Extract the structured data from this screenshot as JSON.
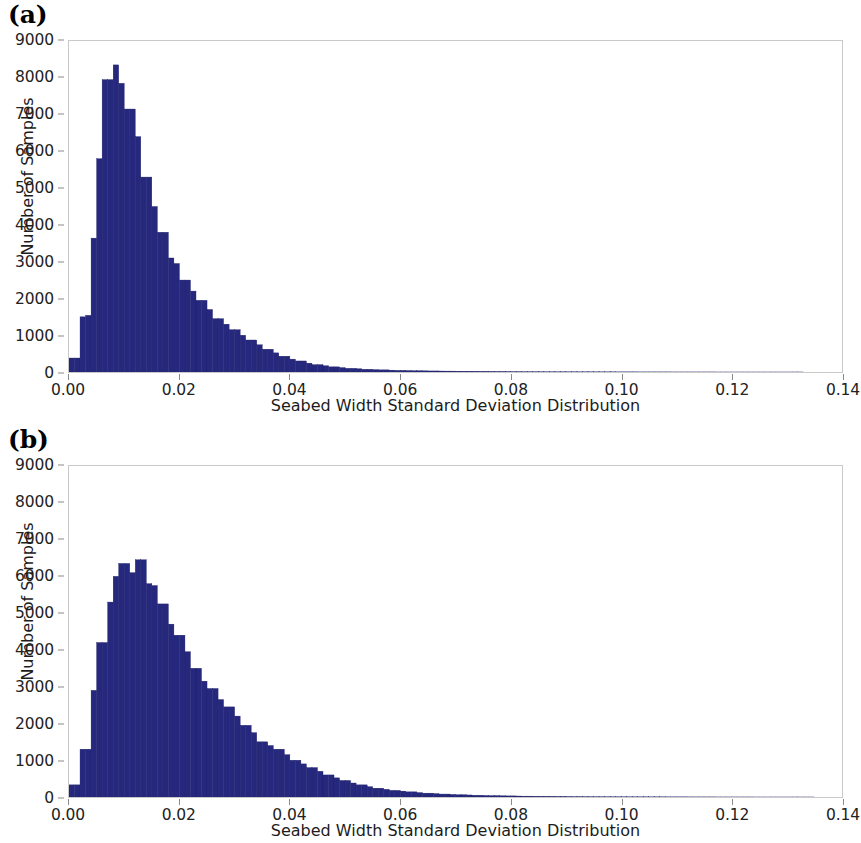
{
  "figure": {
    "panels": [
      {
        "id": "a",
        "label": "(a)"
      },
      {
        "id": "b",
        "label": "(b)"
      }
    ]
  },
  "chart_data": [
    {
      "type": "bar",
      "panel": "(a)",
      "title": "",
      "xlabel": "Seabed Width Standard Deviation Distribution",
      "ylabel": "Number of Samples",
      "xlim": [
        0.0,
        0.14
      ],
      "ylim": [
        0,
        9000
      ],
      "grid": false,
      "legend": "none",
      "bar_color": "#26287e",
      "bin_width": 0.001,
      "xticks": [
        "0.00",
        "0.02",
        "0.04",
        "0.06",
        "0.08",
        "0.10",
        "0.12",
        "0.14"
      ],
      "xtick_values": [
        0.0,
        0.02,
        0.04,
        0.06,
        0.08,
        0.1,
        0.12,
        0.14
      ],
      "yticks": [
        "0",
        "1000",
        "2000",
        "3000",
        "4000",
        "5000",
        "6000",
        "7000",
        "8000",
        "9000"
      ],
      "ytick_values": [
        0,
        1000,
        2000,
        3000,
        4000,
        5000,
        6000,
        7000,
        8000,
        9000
      ],
      "bin_centers": [
        0.0005,
        0.0015,
        0.0025,
        0.0035,
        0.0045,
        0.0055,
        0.0065,
        0.0075,
        0.0085,
        0.0095,
        0.0105,
        0.0115,
        0.0125,
        0.0135,
        0.0145,
        0.0155,
        0.0165,
        0.0175,
        0.0185,
        0.0195,
        0.0205,
        0.0215,
        0.0225,
        0.0235,
        0.0245,
        0.0255,
        0.0265,
        0.0275,
        0.0285,
        0.0295,
        0.0305,
        0.0315,
        0.0325,
        0.0335,
        0.0345,
        0.0355,
        0.0365,
        0.0375,
        0.0385,
        0.0395,
        0.0405,
        0.0415,
        0.0425,
        0.0435,
        0.0445,
        0.0455,
        0.0465,
        0.0475,
        0.0485,
        0.0495,
        0.0505,
        0.0515,
        0.0525,
        0.0535,
        0.0545,
        0.0555,
        0.0565,
        0.0575,
        0.0585,
        0.0595,
        0.0605,
        0.0615,
        0.0625,
        0.0635,
        0.0645,
        0.0655,
        0.0665,
        0.0675,
        0.0685,
        0.0695,
        0.0705,
        0.0715,
        0.0725,
        0.0735,
        0.0745,
        0.0755,
        0.0765,
        0.0775,
        0.0785,
        0.0795,
        0.0805,
        0.0815,
        0.0825,
        0.0835,
        0.0845,
        0.0855,
        0.0865,
        0.0875,
        0.0885,
        0.0895,
        0.0905,
        0.0915,
        0.0925,
        0.0935,
        0.0945,
        0.0955,
        0.0965,
        0.0975,
        0.0985,
        0.0995,
        0.1005,
        0.1015,
        0.1025,
        0.1035,
        0.1045,
        0.1055,
        0.1065,
        0.1075,
        0.1085,
        0.1095,
        0.1105,
        0.1115,
        0.1125,
        0.1135,
        0.1145,
        0.1155,
        0.1165,
        0.1175,
        0.1185,
        0.1195,
        0.1205,
        0.1215,
        0.1225,
        0.1235,
        0.1245,
        0.1255,
        0.1265,
        0.1275,
        0.1285,
        0.1295,
        0.1305,
        0.1315,
        0.1325,
        0.1335,
        0.1345,
        0.1355,
        0.1365,
        0.1375,
        0.1385,
        0.1395
      ],
      "values": [
        380,
        380,
        1500,
        1540,
        3640,
        5800,
        7950,
        7950,
        8350,
        7850,
        7150,
        7150,
        6400,
        5300,
        5300,
        4500,
        3800,
        3800,
        3100,
        2950,
        2500,
        2500,
        2200,
        1950,
        1950,
        1700,
        1450,
        1450,
        1300,
        1150,
        1150,
        1000,
        870,
        870,
        740,
        620,
        620,
        520,
        430,
        430,
        350,
        300,
        300,
        240,
        200,
        200,
        170,
        140,
        140,
        120,
        100,
        100,
        88,
        75,
        75,
        65,
        58,
        58,
        50,
        45,
        45,
        40,
        36,
        36,
        32,
        29,
        29,
        26,
        24,
        24,
        22,
        20,
        20,
        18,
        17,
        17,
        15,
        14,
        14,
        13,
        12,
        12,
        11,
        10,
        10,
        9,
        9,
        8,
        8,
        8,
        7,
        7,
        6,
        6,
        6,
        5,
        5,
        5,
        5,
        4,
        4,
        4,
        4,
        3,
        3,
        3,
        3,
        3,
        3,
        2,
        2,
        2,
        2,
        2,
        2,
        2,
        2,
        1,
        1,
        1,
        1,
        1,
        1,
        1,
        1,
        1,
        1,
        1,
        1,
        1,
        1,
        1,
        1,
        0,
        0,
        0,
        0,
        0,
        0,
        0
      ]
    },
    {
      "type": "bar",
      "panel": "(b)",
      "title": "",
      "xlabel": "Seabed Width Standard Deviation Distribution",
      "ylabel": "Number of Samples",
      "xlim": [
        0.0,
        0.14
      ],
      "ylim": [
        0,
        9000
      ],
      "grid": false,
      "legend": "none",
      "bar_color": "#26287e",
      "bin_width": 0.001,
      "xticks": [
        "0.00",
        "0.02",
        "0.04",
        "0.06",
        "0.08",
        "0.10",
        "0.12",
        "0.14"
      ],
      "xtick_values": [
        0.0,
        0.02,
        0.04,
        0.06,
        0.08,
        0.1,
        0.12,
        0.14
      ],
      "yticks": [
        "0",
        "1000",
        "2000",
        "3000",
        "4000",
        "5000",
        "6000",
        "7000",
        "8000",
        "9000"
      ],
      "ytick_values": [
        0,
        1000,
        2000,
        3000,
        4000,
        5000,
        6000,
        7000,
        8000,
        9000
      ],
      "bin_centers": [
        0.0005,
        0.0015,
        0.0025,
        0.0035,
        0.0045,
        0.0055,
        0.0065,
        0.0075,
        0.0085,
        0.0095,
        0.0105,
        0.0115,
        0.0125,
        0.0135,
        0.0145,
        0.0155,
        0.0165,
        0.0175,
        0.0185,
        0.0195,
        0.0205,
        0.0215,
        0.0225,
        0.0235,
        0.0245,
        0.0255,
        0.0265,
        0.0275,
        0.0285,
        0.0295,
        0.0305,
        0.0315,
        0.0325,
        0.0335,
        0.0345,
        0.0355,
        0.0365,
        0.0375,
        0.0385,
        0.0395,
        0.0405,
        0.0415,
        0.0425,
        0.0435,
        0.0445,
        0.0455,
        0.0465,
        0.0475,
        0.0485,
        0.0495,
        0.0505,
        0.0515,
        0.0525,
        0.0535,
        0.0545,
        0.0555,
        0.0565,
        0.0575,
        0.0585,
        0.0595,
        0.0605,
        0.0615,
        0.0625,
        0.0635,
        0.0645,
        0.0655,
        0.0665,
        0.0675,
        0.0685,
        0.0695,
        0.0705,
        0.0715,
        0.0725,
        0.0735,
        0.0745,
        0.0755,
        0.0765,
        0.0775,
        0.0785,
        0.0795,
        0.0805,
        0.0815,
        0.0825,
        0.0835,
        0.0845,
        0.0855,
        0.0865,
        0.0875,
        0.0885,
        0.0895,
        0.0905,
        0.0915,
        0.0925,
        0.0935,
        0.0945,
        0.0955,
        0.0965,
        0.0975,
        0.0985,
        0.0995,
        0.1005,
        0.1015,
        0.1025,
        0.1035,
        0.1045,
        0.1055,
        0.1065,
        0.1075,
        0.1085,
        0.1095,
        0.1105,
        0.1115,
        0.1125,
        0.1135,
        0.1145,
        0.1155,
        0.1165,
        0.1175,
        0.1185,
        0.1195,
        0.1205,
        0.1215,
        0.1225,
        0.1235,
        0.1245,
        0.1255,
        0.1265,
        0.1275,
        0.1285,
        0.1295,
        0.1305,
        0.1315,
        0.1325,
        0.1335,
        0.1345,
        0.1355,
        0.1365,
        0.1375,
        0.1385,
        0.1395
      ],
      "values": [
        330,
        330,
        1300,
        1300,
        2900,
        4200,
        4200,
        5300,
        6000,
        6350,
        6350,
        6100,
        6450,
        6450,
        5800,
        5750,
        5250,
        5250,
        4700,
        4400,
        4400,
        3950,
        3500,
        3500,
        3150,
        2950,
        2950,
        2650,
        2450,
        2450,
        2200,
        1950,
        1950,
        1750,
        1500,
        1500,
        1400,
        1300,
        1300,
        1150,
        1000,
        1000,
        900,
        800,
        800,
        700,
        600,
        600,
        520,
        450,
        450,
        380,
        330,
        330,
        280,
        240,
        240,
        210,
        180,
        180,
        160,
        140,
        140,
        120,
        105,
        105,
        92,
        80,
        80,
        70,
        62,
        62,
        55,
        48,
        48,
        42,
        38,
        38,
        33,
        30,
        30,
        26,
        23,
        23,
        20,
        18,
        18,
        16,
        15,
        15,
        13,
        12,
        12,
        11,
        10,
        10,
        9,
        8,
        8,
        8,
        7,
        7,
        6,
        6,
        6,
        5,
        5,
        5,
        4,
        4,
        4,
        4,
        3,
        3,
        3,
        3,
        3,
        2,
        2,
        2,
        2,
        2,
        2,
        2,
        1,
        1,
        1,
        1,
        1,
        1,
        1,
        1,
        1,
        1,
        1,
        0,
        0,
        0,
        0,
        0,
        0
      ]
    }
  ]
}
